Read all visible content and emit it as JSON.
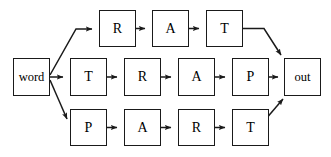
{
  "diagram": {
    "type": "lattice-word-graph",
    "title": "",
    "background_color": "#ffffff",
    "stroke_color": "#1a1a1a",
    "width": 331,
    "height": 157,
    "nodes": [
      {
        "id": "word",
        "label": "word",
        "x": 13,
        "y": 58,
        "w": 37,
        "h": 38,
        "row": "entry",
        "style": "word"
      },
      {
        "id": "t_r",
        "label": "R",
        "x": 99,
        "y": 10,
        "w": 37,
        "h": 37,
        "row": "top",
        "style": "letter"
      },
      {
        "id": "t_a",
        "label": "A",
        "x": 152,
        "y": 10,
        "w": 37,
        "h": 37,
        "row": "top",
        "style": "letter"
      },
      {
        "id": "t_t",
        "label": "T",
        "x": 206,
        "y": 10,
        "w": 37,
        "h": 37,
        "row": "top",
        "style": "letter"
      },
      {
        "id": "m_t",
        "label": "T",
        "x": 70,
        "y": 58,
        "w": 37,
        "h": 38,
        "row": "middle",
        "style": "letter"
      },
      {
        "id": "m_r",
        "label": "R",
        "x": 124,
        "y": 58,
        "w": 37,
        "h": 38,
        "row": "middle",
        "style": "letter"
      },
      {
        "id": "m_a",
        "label": "A",
        "x": 178,
        "y": 58,
        "w": 37,
        "h": 38,
        "row": "middle",
        "style": "letter"
      },
      {
        "id": "m_p",
        "label": "P",
        "x": 232,
        "y": 58,
        "w": 37,
        "h": 38,
        "row": "middle",
        "style": "letter"
      },
      {
        "id": "b_p",
        "label": "P",
        "x": 70,
        "y": 109,
        "w": 37,
        "h": 37,
        "row": "bottom",
        "style": "letter"
      },
      {
        "id": "b_a",
        "label": "A",
        "x": 124,
        "y": 109,
        "w": 37,
        "h": 37,
        "row": "bottom",
        "style": "letter"
      },
      {
        "id": "b_r",
        "label": "R",
        "x": 178,
        "y": 109,
        "w": 37,
        "h": 37,
        "row": "bottom",
        "style": "letter"
      },
      {
        "id": "b_t",
        "label": "T",
        "x": 232,
        "y": 109,
        "w": 37,
        "h": 37,
        "row": "bottom",
        "style": "letter"
      },
      {
        "id": "out",
        "label": "out",
        "x": 284,
        "y": 58,
        "w": 37,
        "h": 38,
        "row": "exit",
        "style": "word"
      }
    ],
    "paths": {
      "top": [
        "word",
        "t_r",
        "t_a",
        "t_t",
        "out"
      ],
      "middle": [
        "word",
        "m_t",
        "m_r",
        "m_a",
        "m_p",
        "out"
      ],
      "bottom": [
        "word",
        "b_p",
        "b_a",
        "b_r",
        "b_t",
        "out"
      ]
    },
    "path_strings": {
      "top": "RAT",
      "middle": "TRAP",
      "bottom": "PART"
    }
  }
}
